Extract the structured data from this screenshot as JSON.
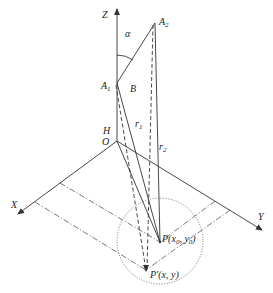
{
  "diagram": {
    "type": "3d-geometry",
    "axes": {
      "z_label": "Z",
      "x_label": "X",
      "y_label": "Y",
      "origin_label": "O"
    },
    "points": {
      "a1": {
        "base": "A",
        "sub": "1"
      },
      "a2": {
        "base": "A",
        "sub": "2"
      },
      "b": "B",
      "p": {
        "text": "P(x",
        "sub1": "0",
        "mid": ", y",
        "sub2": "0",
        "end": ")"
      },
      "p_prime": "P'(x, y)"
    },
    "measures": {
      "alpha": "α",
      "h": "H",
      "r1": {
        "base": "r",
        "sub": "1"
      },
      "r2": {
        "base": "r",
        "sub": "2"
      }
    },
    "colors": {
      "line": "#333333",
      "guide": "#555555",
      "background": "#ffffff"
    }
  }
}
